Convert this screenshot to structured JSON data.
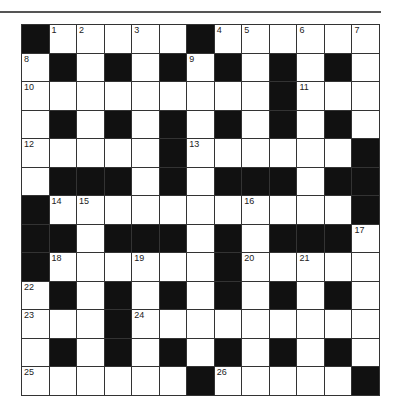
{
  "puzzle": {
    "rows": 13,
    "cols": 13,
    "colors": {
      "block": "#111111",
      "cell": "#ffffff",
      "rule": "#555555"
    },
    "grid": [
      [
        "#",
        "1",
        "2",
        ".",
        "3",
        ".",
        "#",
        "4",
        "5",
        ".",
        "6",
        ".",
        "7"
      ],
      [
        "8",
        "#",
        ".",
        "#",
        ".",
        "#",
        "9",
        "#",
        ".",
        "#",
        ".",
        "#",
        "."
      ],
      [
        "10",
        ".",
        ".",
        ".",
        ".",
        ".",
        ".",
        ".",
        ".",
        "#",
        "11",
        ".",
        "."
      ],
      [
        ".",
        "#",
        ".",
        "#",
        ".",
        "#",
        ".",
        "#",
        ".",
        "#",
        ".",
        "#",
        "."
      ],
      [
        "12",
        ".",
        ".",
        ".",
        ".",
        "#",
        "13",
        ".",
        ".",
        ".",
        ".",
        ".",
        "#"
      ],
      [
        ".",
        "#",
        "#",
        "#",
        ".",
        "#",
        ".",
        "#",
        "#",
        "#",
        ".",
        "#",
        "#"
      ],
      [
        "#",
        "14",
        "15",
        ".",
        ".",
        ".",
        ".",
        ".",
        "16",
        ".",
        ".",
        ".",
        "#"
      ],
      [
        "#",
        "#",
        ".",
        "#",
        "#",
        "#",
        ".",
        "#",
        ".",
        "#",
        "#",
        "#",
        "17"
      ],
      [
        "#",
        "18",
        ".",
        ".",
        "19",
        ".",
        ".",
        "#",
        "20",
        ".",
        "21",
        ".",
        "."
      ],
      [
        "22",
        "#",
        ".",
        "#",
        ".",
        "#",
        ".",
        "#",
        ".",
        "#",
        ".",
        "#",
        "."
      ],
      [
        "23",
        ".",
        ".",
        "#",
        "24",
        ".",
        ".",
        ".",
        ".",
        ".",
        ".",
        ".",
        "."
      ],
      [
        ".",
        "#",
        ".",
        "#",
        ".",
        "#",
        ".",
        "#",
        ".",
        "#",
        ".",
        "#",
        "."
      ],
      [
        "25",
        ".",
        ".",
        ".",
        ".",
        ".",
        "#",
        "26",
        ".",
        ".",
        ".",
        ".",
        "#"
      ]
    ]
  }
}
